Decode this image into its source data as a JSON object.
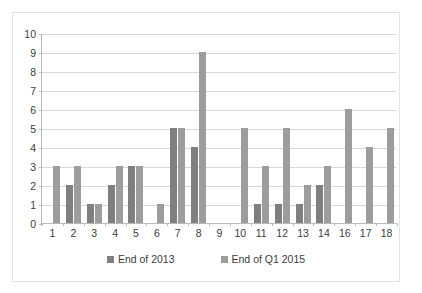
{
  "chart_data": {
    "type": "bar",
    "title": "",
    "subtitle": "",
    "xlabel": "",
    "ylabel": "",
    "ylim": [
      0,
      10
    ],
    "ytick_step": 1,
    "yticks": [
      0,
      1,
      2,
      3,
      4,
      5,
      6,
      7,
      8,
      9,
      10
    ],
    "grid": "horizontal",
    "legend_position": "bottom",
    "categories": [
      "1",
      "2",
      "3",
      "4",
      "5",
      "6",
      "7",
      "8",
      "9",
      "10",
      "11",
      "12",
      "13",
      "14",
      "16",
      "17",
      "18"
    ],
    "series": [
      {
        "name": "End of 2013",
        "color": "#7f7f7f",
        "values": [
          0,
          2,
          1,
          2,
          3,
          0,
          5,
          4,
          0,
          0,
          1,
          1,
          1,
          2,
          0,
          0,
          0
        ]
      },
      {
        "name": "End of Q1 2015",
        "color": "#9d9d9d",
        "values": [
          3,
          3,
          1,
          3,
          3,
          1,
          5,
          9,
          0,
          5,
          3,
          5,
          2,
          3,
          6,
          4,
          5
        ]
      }
    ]
  },
  "legend": {
    "items": [
      {
        "label": "End of 2013"
      },
      {
        "label": "End of Q1 2015"
      }
    ]
  },
  "colors": {
    "series_2013": "#7f7f7f",
    "series_q1_2015": "#9d9d9d",
    "gridline": "#d8d8d8",
    "axis": "#b9b9b9",
    "border": "#e3e3e3",
    "text": "#3d3d3d",
    "background": "#ffffff"
  }
}
